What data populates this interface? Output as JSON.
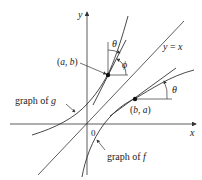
{
  "diagram": {
    "axes": {
      "x_label": "x",
      "y_label": "y",
      "origin_label": "0"
    },
    "line": {
      "label_lhs": "y",
      "label_eq": " = ",
      "label_rhs": "x"
    },
    "points": [
      {
        "label_open": "(",
        "label_a": "a",
        "label_sep": ", ",
        "label_b": "b",
        "label_close": ")"
      },
      {
        "label_open": "(",
        "label_a": "b",
        "label_sep": ", ",
        "label_b": "a",
        "label_close": ")"
      }
    ],
    "angles": {
      "theta_top": "θ",
      "phi": "ϕ",
      "theta_right": "θ"
    },
    "curves": {
      "g_label_prefix": "graph of ",
      "g_label_name": "g",
      "f_label_prefix": "graph of ",
      "f_label_name": "f"
    },
    "colors": {
      "stroke": "#333333",
      "background": "#ffffff"
    }
  }
}
